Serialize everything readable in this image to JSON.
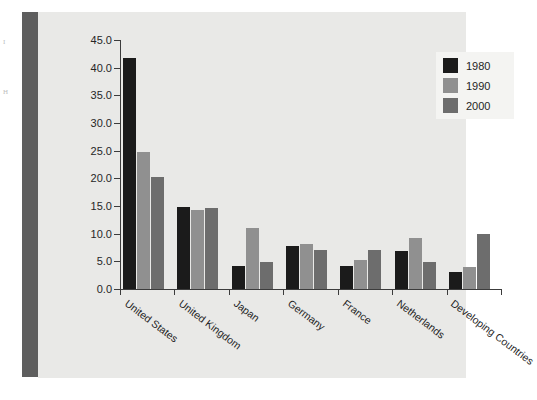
{
  "chart_data": {
    "type": "bar",
    "title": "",
    "subtitle": "",
    "xlabel": "",
    "ylabel": "",
    "ylim": [
      0.0,
      45.0
    ],
    "ytick_step": 5.0,
    "ytick_labels": [
      "45.0",
      "40.0",
      "35.0",
      "30.0",
      "25.0",
      "20.0",
      "15.0",
      "10.0",
      "5.0",
      "0.0"
    ],
    "ytick_values": [
      45.0,
      40.0,
      35.0,
      30.0,
      25.0,
      20.0,
      15.0,
      10.0,
      5.0,
      0.0
    ],
    "grid": false,
    "legend_position": "top-right",
    "categories": [
      "United States",
      "United Kingdom",
      "Japan",
      "Germany",
      "France",
      "Netherlands",
      "Developing Countries"
    ],
    "series": [
      {
        "name": "1980",
        "color": "#1b1b1b",
        "values": [
          41.8,
          14.8,
          4.1,
          7.7,
          4.2,
          6.9,
          3.0
        ]
      },
      {
        "name": "1990",
        "color": "#909090",
        "values": [
          24.8,
          14.2,
          11.0,
          8.1,
          5.3,
          9.3,
          4.0
        ]
      },
      {
        "name": "2000",
        "color": "#6d6d6d",
        "values": [
          20.3,
          14.7,
          4.8,
          7.0,
          7.1,
          4.8,
          10.0
        ]
      }
    ]
  },
  "legend": {
    "entries": [
      {
        "label": "1980",
        "swatch": "#1b1b1b"
      },
      {
        "label": "1990",
        "swatch": "#909090"
      },
      {
        "label": "2000",
        "swatch": "#6d6d6d"
      }
    ]
  },
  "page": {
    "margin_marks": [
      "I",
      "H"
    ],
    "panel_background": "#e9e9e7",
    "binding_color": "#5e5e5e"
  }
}
